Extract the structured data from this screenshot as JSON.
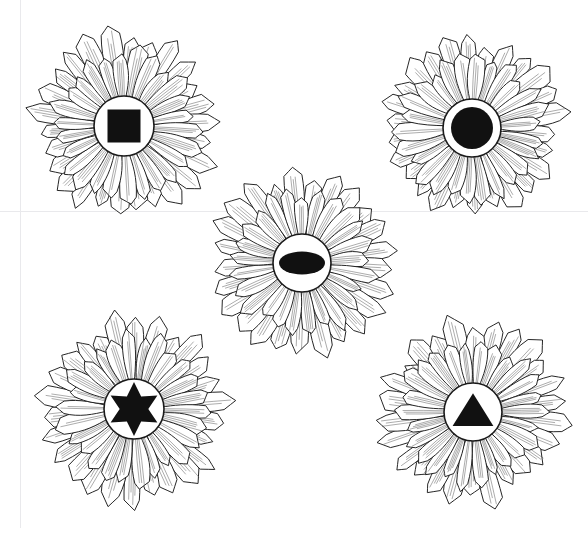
{
  "image": {
    "title": "Five sunflower line drawings with black geometric shapes at their centers",
    "style": "black-and-white line art on white background",
    "width": 588,
    "height": 535,
    "background_color": "#ffffff",
    "stroke_color": "#1a1a1a",
    "shape_fill_color": "#111111",
    "disc_fill_color": "#ffffff"
  },
  "guides": [
    {
      "name": "vertical-margin-guide",
      "orientation": "vertical",
      "x": 20,
      "y": 0,
      "length": 528,
      "color": "#e9e9ec"
    },
    {
      "name": "horizontal-margin-guide",
      "orientation": "horizontal",
      "x": 0,
      "y": 211,
      "length": 588,
      "color": "#e9e9ec"
    }
  ],
  "flowers": [
    {
      "id": "flower-top-left",
      "label": "Sunflower with black square center",
      "center_shape": "square",
      "shape_label": "square",
      "cx": 124,
      "cy": 126,
      "petal_outer": 94,
      "petal_inner": 30,
      "disc_radius": 30,
      "petal_count": 26,
      "rotation": 4,
      "shape_size": 33,
      "seed": 11
    },
    {
      "id": "flower-top-right",
      "label": "Sunflower with black circle center",
      "center_shape": "circle",
      "shape_label": "circle",
      "cx": 472,
      "cy": 128,
      "petal_outer": 92,
      "petal_inner": 29,
      "disc_radius": 29,
      "petal_count": 26,
      "rotation": 11,
      "shape_size": 42,
      "seed": 27
    },
    {
      "id": "flower-center",
      "label": "Sunflower with black horizontal ellipse center",
      "center_shape": "ellipse",
      "shape_label": "ellipse",
      "cx": 302,
      "cy": 263,
      "petal_outer": 91,
      "petal_inner": 29,
      "disc_radius": 29,
      "petal_count": 25,
      "rotation": 8,
      "shape_size": 46,
      "shape_size_y": 23,
      "seed": 41
    },
    {
      "id": "flower-bottom-left",
      "label": "Sunflower with black six-pointed star center",
      "center_shape": "star6",
      "shape_label": "six-pointed star",
      "cx": 134,
      "cy": 409,
      "petal_outer": 93,
      "petal_inner": 30,
      "disc_radius": 30,
      "petal_count": 26,
      "rotation": 2,
      "shape_size": 27,
      "seed": 59
    },
    {
      "id": "flower-bottom-right",
      "label": "Sunflower with black triangle center",
      "center_shape": "triangle",
      "shape_label": "triangle",
      "cx": 473,
      "cy": 412,
      "petal_outer": 92,
      "petal_inner": 29,
      "disc_radius": 29,
      "petal_count": 26,
      "rotation": 14,
      "shape_size": 34,
      "seed": 73
    }
  ]
}
